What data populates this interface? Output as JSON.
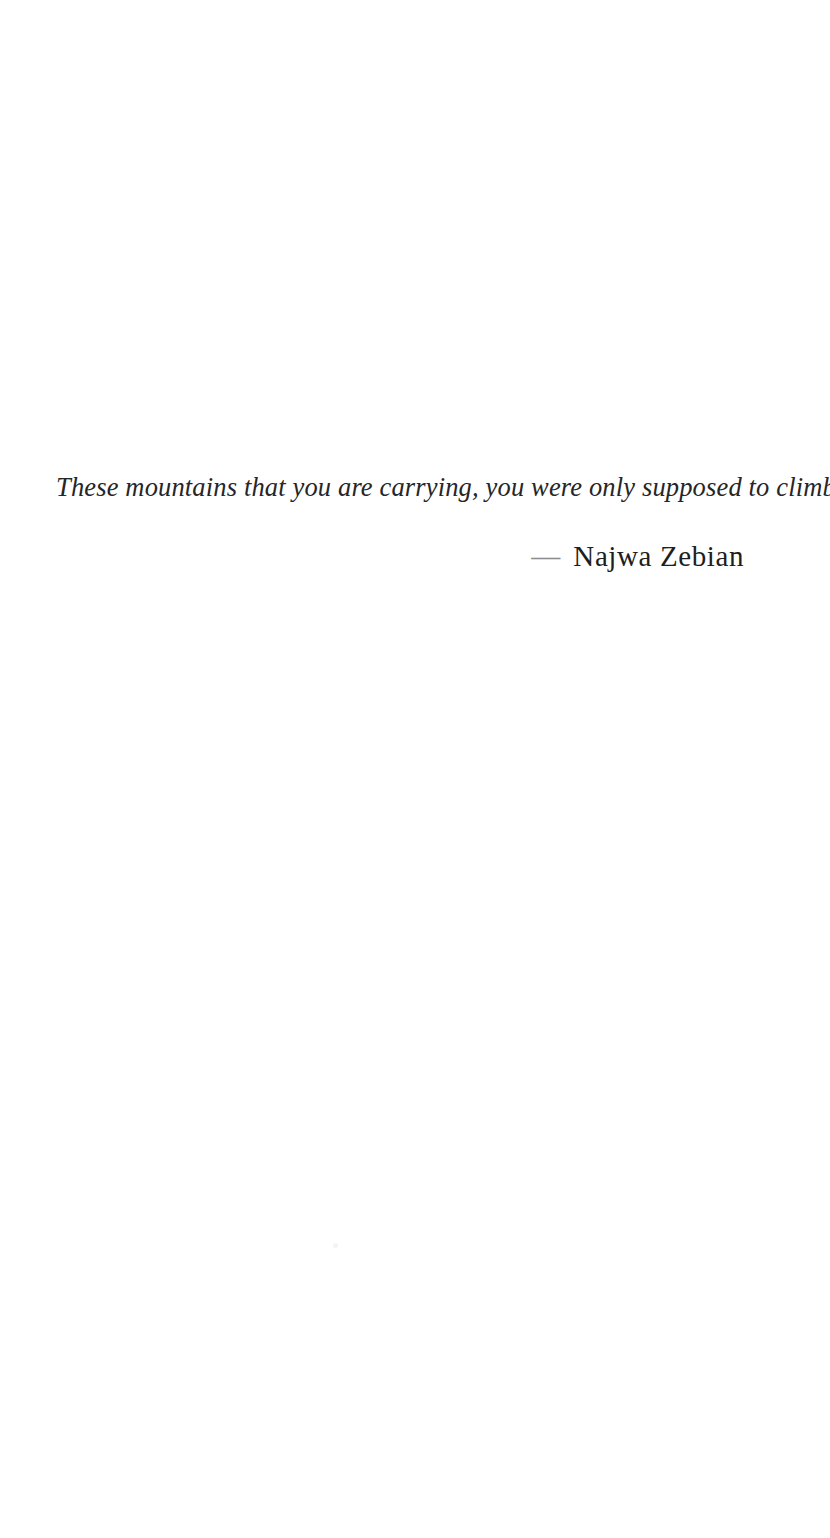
{
  "page": {
    "background_color": "#ffffff",
    "width": 830,
    "height": 1538
  },
  "quote": {
    "text": "These mountains that you are carrying, you were only supposed to climb.",
    "color": "#262628",
    "style": "italic"
  },
  "attribution": {
    "dash": "—",
    "dash_color": "#8d8d90",
    "name": "Najwa Zebian",
    "name_color": "#1e1e20"
  },
  "artifact": {
    "label": "scan-speck"
  }
}
